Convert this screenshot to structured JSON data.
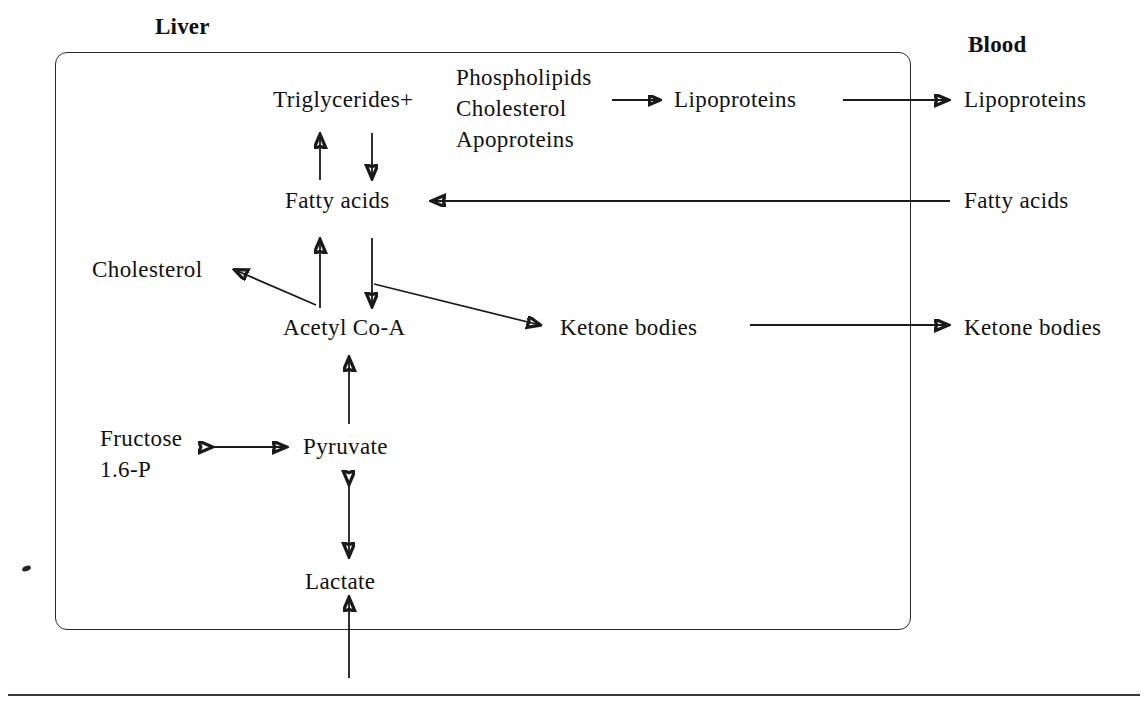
{
  "diagram": {
    "title_left": "Liver",
    "title_right": "Blood",
    "type": "metabolic-pathway-flow",
    "compartments": [
      {
        "id": "liver",
        "label": "Liver",
        "bounded": true
      },
      {
        "id": "blood",
        "label": "Blood",
        "bounded": false
      }
    ],
    "nodes": {
      "triglycerides": "Triglycerides+",
      "precursor_line1": "Phospholipids",
      "precursor_line2": "Cholesterol",
      "precursor_line3": "Apoproteins",
      "lipoproteins_liver": "Lipoproteins",
      "lipoproteins_blood": "Lipoproteins",
      "fatty_acids_liver": "Fatty acids",
      "fatty_acids_blood": "Fatty acids",
      "cholesterol": "Cholesterol",
      "acetyl_coa": "Acetyl Co-A",
      "ketone_bodies_liver": "Ketone bodies",
      "ketone_bodies_blood": "Ketone bodies",
      "fructose_line1": "Fructose",
      "fructose_line2": "1.6-P",
      "pyruvate": "Pyruvate",
      "lactate": "Lactate"
    },
    "edges": [
      {
        "from": "fatty_acids_liver",
        "to": "triglycerides",
        "direction": "up"
      },
      {
        "from": "triglycerides",
        "to": "fatty_acids_liver",
        "direction": "down"
      },
      {
        "from": "precursors",
        "to": "lipoproteins_liver",
        "direction": "right"
      },
      {
        "from": "lipoproteins_liver",
        "to": "lipoproteins_blood",
        "direction": "right"
      },
      {
        "from": "fatty_acids_blood",
        "to": "fatty_acids_liver",
        "direction": "left"
      },
      {
        "from": "acetyl_coa",
        "to": "fatty_acids_liver",
        "direction": "up"
      },
      {
        "from": "fatty_acids_liver",
        "to": "acetyl_coa",
        "direction": "down"
      },
      {
        "from": "acetyl_coa",
        "to": "cholesterol",
        "direction": "up-left"
      },
      {
        "from": "fatty_acids_liver",
        "to": "ketone_bodies_liver",
        "direction": "down-right"
      },
      {
        "from": "ketone_bodies_liver",
        "to": "ketone_bodies_blood",
        "direction": "right"
      },
      {
        "from": "pyruvate",
        "to": "acetyl_coa",
        "direction": "up"
      },
      {
        "from": "fructose",
        "to": "pyruvate",
        "direction": "both"
      },
      {
        "from": "lactate",
        "to": "pyruvate",
        "direction": "both"
      },
      {
        "from": "external",
        "to": "lactate",
        "direction": "up"
      }
    ],
    "colors": {
      "ink": "#111111",
      "stroke": "#1a1a1a",
      "box_border": "#2a2a2a",
      "background": "#fefefe"
    }
  }
}
